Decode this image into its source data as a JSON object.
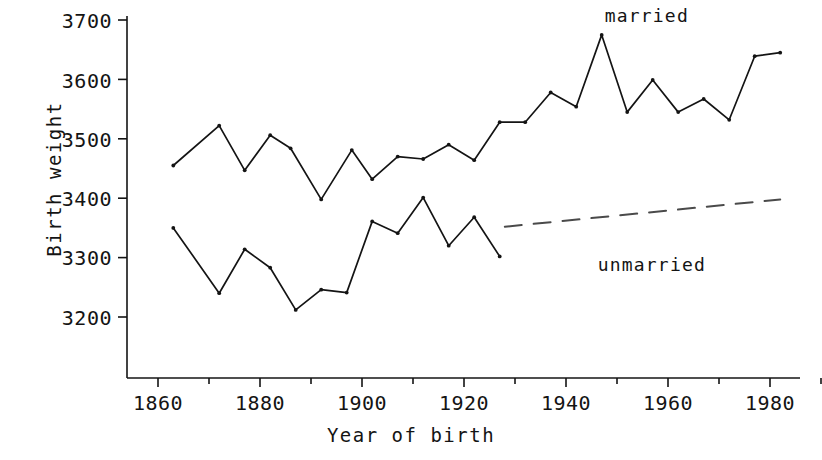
{
  "chart_data": {
    "type": "line",
    "title": "",
    "xlabel": "Year of birth",
    "ylabel": "Birth weight",
    "xlim": [
      1858,
      1986
    ],
    "ylim": [
      3150,
      3715
    ],
    "grid": false,
    "legend_position": "inline-annotations",
    "x_ticks_major": [
      1860,
      1880,
      1900,
      1920,
      1940,
      1960,
      1980
    ],
    "x_ticks_minor": [
      1870,
      1890,
      1910,
      1930,
      1950,
      1970
    ],
    "y_ticks": [
      3200,
      3300,
      3400,
      3500,
      3600,
      3700
    ],
    "annotations": [
      {
        "text": "married",
        "x": 1957,
        "y": 3705
      },
      {
        "text": "unmarried",
        "x": 1957,
        "y": 3290
      }
    ],
    "series": [
      {
        "name": "married",
        "style": "solid",
        "marker": "dot",
        "color": "#141414",
        "points": [
          {
            "x": 1863,
            "y": 3455
          },
          {
            "x": 1872,
            "y": 3522
          },
          {
            "x": 1877,
            "y": 3447
          },
          {
            "x": 1882,
            "y": 3506
          },
          {
            "x": 1886,
            "y": 3484
          },
          {
            "x": 1892,
            "y": 3398
          },
          {
            "x": 1898,
            "y": 3481
          },
          {
            "x": 1902,
            "y": 3432
          },
          {
            "x": 1907,
            "y": 3470
          },
          {
            "x": 1912,
            "y": 3466
          },
          {
            "x": 1917,
            "y": 3490
          },
          {
            "x": 1922,
            "y": 3464
          },
          {
            "x": 1927,
            "y": 3528
          },
          {
            "x": 1932,
            "y": 3528
          },
          {
            "x": 1937,
            "y": 3578
          },
          {
            "x": 1942,
            "y": 3554
          },
          {
            "x": 1947,
            "y": 3675
          },
          {
            "x": 1952,
            "y": 3545
          },
          {
            "x": 1957,
            "y": 3599
          },
          {
            "x": 1962,
            "y": 3545
          },
          {
            "x": 1967,
            "y": 3567
          },
          {
            "x": 1972,
            "y": 3532
          },
          {
            "x": 1977,
            "y": 3639
          },
          {
            "x": 1982,
            "y": 3645
          }
        ]
      },
      {
        "name": "unmarried",
        "style": "solid",
        "marker": "dot",
        "color": "#141414",
        "points": [
          {
            "x": 1863,
            "y": 3350
          },
          {
            "x": 1872,
            "y": 3240
          },
          {
            "x": 1877,
            "y": 3314
          },
          {
            "x": 1882,
            "y": 3283
          },
          {
            "x": 1887,
            "y": 3212
          },
          {
            "x": 1892,
            "y": 3246
          },
          {
            "x": 1897,
            "y": 3241
          },
          {
            "x": 1902,
            "y": 3361
          },
          {
            "x": 1907,
            "y": 3341
          },
          {
            "x": 1912,
            "y": 3401
          },
          {
            "x": 1917,
            "y": 3320
          },
          {
            "x": 1922,
            "y": 3368
          },
          {
            "x": 1927,
            "y": 3302
          }
        ]
      },
      {
        "name": "unmarried-trend",
        "style": "dashed",
        "marker": "none",
        "color": "#4a4a4a",
        "points": [
          {
            "x": 1928,
            "y": 3352
          },
          {
            "x": 1982,
            "y": 3398
          }
        ]
      }
    ]
  },
  "axes": {
    "y_title": "Birth weight",
    "x_title": "Year of birth",
    "y_tick_labels": [
      "3700",
      "3600",
      "3500",
      "3400",
      "3300",
      "3200"
    ],
    "x_tick_labels": [
      "1860",
      "1880",
      "1900",
      "1920",
      "1940",
      "1960",
      "1980"
    ]
  },
  "labels": {
    "married": "married",
    "unmarried": "unmarried"
  }
}
